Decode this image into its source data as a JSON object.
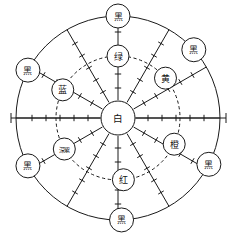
{
  "figure": {
    "center": {
      "label": "白",
      "role": "center-node",
      "cx": 118,
      "cy": 118,
      "r": 17
    },
    "geometry": {
      "outer_radius": 102,
      "inner_dashed_radius": 62,
      "spoke_count": 12,
      "axis_extends_beyond_circle": true,
      "axis_left_end_x": 11,
      "axis_right_end_x": 226
    },
    "colors": {
      "ink": "#1a1a1a",
      "paper": "#ffffff"
    },
    "inner_nodes": [
      {
        "label": "绿",
        "angle_deg": 270,
        "radius": 62,
        "r": 11,
        "chars": 1
      },
      {
        "label": "黄",
        "angle_deg": 320,
        "radius": 62,
        "r": 11,
        "chars": 1
      },
      {
        "label": "橙",
        "angle_deg": 25,
        "radius": 62,
        "r": 11,
        "chars": 1
      },
      {
        "label": "红",
        "angle_deg": 85,
        "radius": 62,
        "r": 11,
        "chars": 1
      },
      {
        "label": "深紫",
        "angle_deg": 150,
        "radius": 62,
        "r": 11,
        "chars": 2
      },
      {
        "label": "蓝",
        "angle_deg": 207,
        "radius": 62,
        "r": 11,
        "chars": 1
      }
    ],
    "outer_nodes": [
      {
        "label": "黑",
        "angle_deg": 270,
        "radius": 102,
        "r": 12,
        "chars": 1
      },
      {
        "label": "黑",
        "angle_deg": 318,
        "radius": 102,
        "r": 12,
        "chars": 1
      },
      {
        "label": "黑",
        "angle_deg": 27,
        "radius": 102,
        "r": 12,
        "chars": 1
      },
      {
        "label": "黑",
        "angle_deg": 88,
        "radius": 102,
        "r": 12,
        "chars": 1
      },
      {
        "label": "黑",
        "angle_deg": 152,
        "radius": 102,
        "r": 12,
        "chars": 1
      },
      {
        "label": "黑",
        "angle_deg": 208,
        "radius": 102,
        "r": 12,
        "chars": 1
      }
    ],
    "spoke_angles_deg": [
      0,
      30,
      60,
      90,
      120,
      150,
      180,
      210,
      240,
      270,
      300,
      330
    ],
    "tick_radii": [
      30,
      44,
      58,
      72,
      86
    ],
    "axis_ticks_left": [
      118,
      132,
      146,
      160
    ],
    "axis_ticks_right": [
      118,
      132,
      146,
      160
    ]
  }
}
